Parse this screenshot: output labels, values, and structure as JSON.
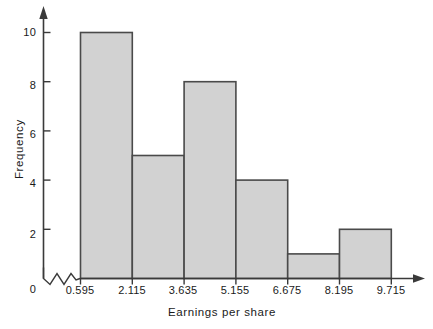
{
  "chart_data": {
    "type": "bar",
    "title": "",
    "subtitle": "",
    "xlabel": "Earnings per share",
    "ylabel": "Frequency",
    "categories": [
      "0.595-2.115",
      "2.115-3.635",
      "3.635-5.155",
      "5.155-6.675",
      "6.675-8.195",
      "8.195-9.715"
    ],
    "bin_edges": [
      "0.595",
      "2.115",
      "3.635",
      "5.155",
      "6.675",
      "8.195",
      "9.715"
    ],
    "values": [
      10,
      5,
      8,
      4,
      1,
      2
    ],
    "x_tick_labels": [
      "0.595",
      "2.115",
      "3.635",
      "5.155",
      "6.675",
      "8.195",
      "9.715"
    ],
    "y_tick_labels": [
      "0",
      "2",
      "4",
      "6",
      "8",
      "10"
    ],
    "y_tick_values": [
      0,
      2,
      4,
      6,
      8,
      10
    ],
    "ylim": [
      0,
      10
    ],
    "xlim": [
      0.595,
      9.715
    ],
    "grid": false,
    "legend": false,
    "origin_label": "0",
    "axis_break": true,
    "bar_fill_color": "#d2d2d2",
    "bar_border_color": "#4a4a4a",
    "axis_color": "#3a3a3a",
    "background_color": "#ffffff"
  }
}
